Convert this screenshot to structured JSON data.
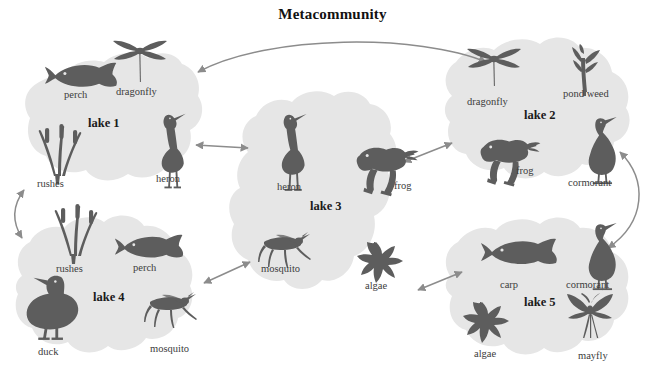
{
  "title": "Metacommunity",
  "colors": {
    "blob_fill": "#e6e6e6",
    "silhouette": "#5d5d5d",
    "arrow": "#8c8c8c",
    "label_text": "#3c3c3c",
    "lake_text": "#1a1a1a",
    "background": "#ffffff"
  },
  "lakes": [
    {
      "id": "lake-1",
      "label": "lake 1",
      "species": [
        {
          "name": "perch",
          "icon": "fish-icon"
        },
        {
          "name": "dragonfly",
          "icon": "dragonfly-icon"
        },
        {
          "name": "rushes",
          "icon": "rushes-icon"
        },
        {
          "name": "heron",
          "icon": "heron-icon"
        }
      ]
    },
    {
      "id": "lake-2",
      "label": "lake 2",
      "species": [
        {
          "name": "dragonfly",
          "icon": "dragonfly-icon"
        },
        {
          "name": "pond weed",
          "icon": "pondweed-icon"
        },
        {
          "name": "frog",
          "icon": "frog-icon"
        },
        {
          "name": "cormorant",
          "icon": "cormorant-icon"
        }
      ]
    },
    {
      "id": "lake-3",
      "label": "lake 3",
      "species": [
        {
          "name": "heron",
          "icon": "heron-icon"
        },
        {
          "name": "frog",
          "icon": "frog-icon"
        },
        {
          "name": "mosquito",
          "icon": "mosquito-icon"
        },
        {
          "name": "algae",
          "icon": "algae-icon"
        }
      ]
    },
    {
      "id": "lake-4",
      "label": "lake 4",
      "species": [
        {
          "name": "rushes",
          "icon": "rushes-icon"
        },
        {
          "name": "perch",
          "icon": "fish-icon"
        },
        {
          "name": "duck",
          "icon": "duck-icon"
        },
        {
          "name": "mosquito",
          "icon": "mosquito-icon"
        }
      ]
    },
    {
      "id": "lake-5",
      "label": "lake 5",
      "species": [
        {
          "name": "carp",
          "icon": "fish-icon"
        },
        {
          "name": "cormorant",
          "icon": "cormorant-icon"
        },
        {
          "name": "algae",
          "icon": "algae-icon"
        },
        {
          "name": "mayfly",
          "icon": "mayfly-icon"
        }
      ]
    }
  ],
  "connections": [
    {
      "from": "lake 1",
      "to": "lake 2",
      "style": "curved",
      "heads": "both"
    },
    {
      "from": "lake 1",
      "to": "lake 3",
      "style": "straight",
      "heads": "both"
    },
    {
      "from": "lake 1",
      "to": "lake 4",
      "style": "curved",
      "heads": "both"
    },
    {
      "from": "lake 3",
      "to": "lake 2",
      "style": "straight",
      "heads": "both"
    },
    {
      "from": "lake 3",
      "to": "lake 4",
      "style": "straight",
      "heads": "both"
    },
    {
      "from": "lake 3",
      "to": "lake 5",
      "style": "straight",
      "heads": "both"
    },
    {
      "from": "lake 2",
      "to": "lake 5",
      "style": "curved",
      "heads": "both"
    }
  ]
}
